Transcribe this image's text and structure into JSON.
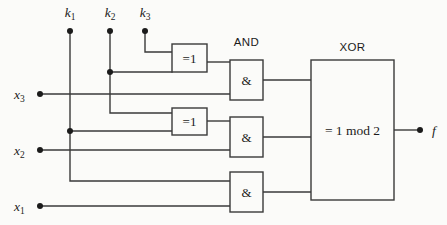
{
  "diagram": {
    "title": "",
    "colors": {
      "background": "#fbfbf9",
      "wire": "#3a3a3a",
      "text": "#1b1b1b",
      "gate_fill": "#fbfbf9"
    },
    "key_inputs": [
      {
        "id": "k1",
        "base": "k",
        "sub": "1"
      },
      {
        "id": "k2",
        "base": "k",
        "sub": "2"
      },
      {
        "id": "k3",
        "base": "k",
        "sub": "3"
      }
    ],
    "data_inputs": [
      {
        "id": "x3",
        "base": "x",
        "sub": "3"
      },
      {
        "id": "x2",
        "base": "x",
        "sub": "2"
      },
      {
        "id": "x1",
        "base": "x",
        "sub": "1"
      }
    ],
    "output": {
      "id": "f",
      "base": "f",
      "sub": ""
    },
    "column_headers": [
      {
        "id": "and-header",
        "label": "AND"
      },
      {
        "id": "xor-header",
        "label": "XOR"
      }
    ],
    "xor_gates": [
      {
        "id": "xor-gate-1",
        "label": "=1"
      },
      {
        "id": "xor-gate-2",
        "label": "=1"
      }
    ],
    "and_gates": [
      {
        "id": "and-gate-1",
        "label": "&"
      },
      {
        "id": "and-gate-2",
        "label": "&"
      },
      {
        "id": "and-gate-3",
        "label": "&"
      }
    ],
    "sum_block": {
      "id": "sum-block",
      "label": "= 1 mod 2"
    }
  }
}
